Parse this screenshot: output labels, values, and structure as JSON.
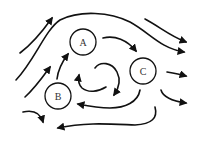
{
  "diagram": {
    "type": "flow-diagram",
    "nodes": [
      {
        "id": "A",
        "label": "A",
        "cx": 83,
        "cy": 42,
        "r": 13
      },
      {
        "id": "B",
        "label": "B",
        "cx": 58,
        "cy": 96,
        "r": 13
      },
      {
        "id": "C",
        "label": "C",
        "cx": 143,
        "cy": 71,
        "r": 13
      }
    ],
    "arrows": [
      {
        "name": "arrow-top-left",
        "d": "M20,53 C32,44 42,32 52,18"
      },
      {
        "name": "arrow-big-top-arc",
        "d": "M16,80 C35,60 45,30 60,20 C80,10 110,12 130,22 C150,33 160,48 184,52"
      },
      {
        "name": "arrow-top-right",
        "d": "M145,19 C160,27 170,36 186,42"
      },
      {
        "name": "arrow-a-to-c",
        "d": "M103,38 C115,35 127,40 136,51"
      },
      {
        "name": "arrow-left-middle",
        "d": "M25,97 C35,88 42,78 50,67"
      },
      {
        "name": "arrow-b-to-a",
        "d": "M57,79 C58,70 62,62 68,54"
      },
      {
        "name": "arrow-center-loop-left",
        "d": "M106,87 C98,92 88,93 82,88 C78,84 78,80 79,75"
      },
      {
        "name": "arrow-center-loop-right",
        "d": "M95,68 C100,61 112,62 117,72 C121,80 119,88 114,95"
      },
      {
        "name": "arrow-c-right",
        "d": "M167,72 C173,73 179,74 186,76"
      },
      {
        "name": "arrow-c-to-b",
        "d": "M140,90 C138,102 125,108 110,108 C98,108 88,106 78,104"
      },
      {
        "name": "arrow-right-lower",
        "d": "M161,90 C163,97 172,101 186,103"
      },
      {
        "name": "arrow-bottom-left-small",
        "d": "M23,112 C32,110 40,112 43,122"
      },
      {
        "name": "arrow-bottom-big",
        "d": "M155,107 C158,118 152,124 135,125 C110,124 85,122 58,128"
      }
    ],
    "stroke_color": "#111111",
    "background": "#ffffff"
  }
}
